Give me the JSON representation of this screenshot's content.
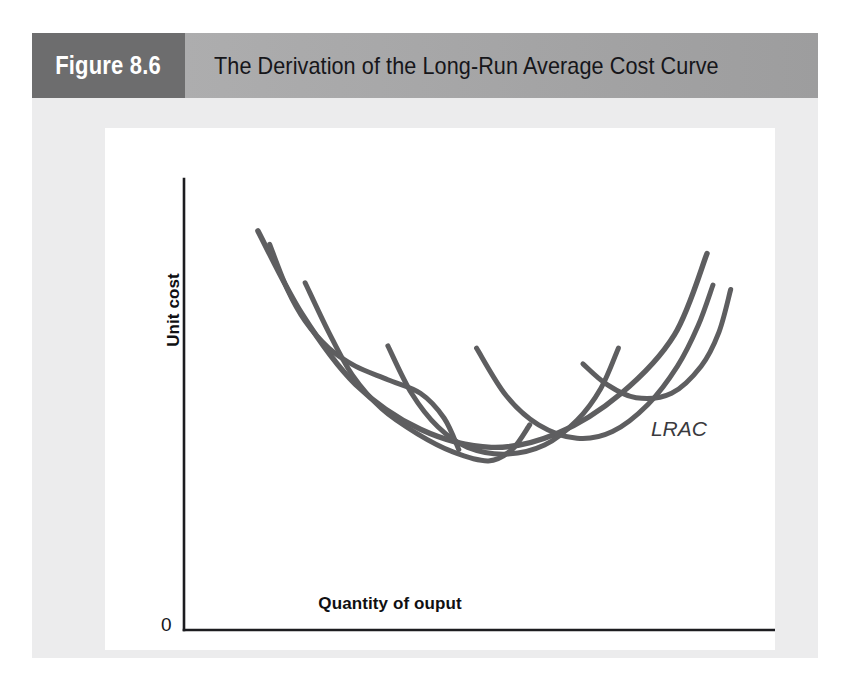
{
  "figure": {
    "number_label": "Figure 8.6",
    "title": "The Derivation of the Long-Run Average Cost Curve",
    "header_dark_color": "#6d6d6e",
    "header_light_color": "#a9a9aa",
    "card_background_color": "#ececed",
    "panel_background_color": "#ffffff"
  },
  "axes": {
    "y_title": "Unit cost",
    "x_title": "Quantity of ouput",
    "origin_label": "0",
    "axis_color": "#1c1c20"
  },
  "annotations": {
    "lrac_label": "LRAC"
  },
  "chart_data": {
    "type": "line",
    "title": "The Derivation of the Long-Run Average Cost Curve",
    "xlabel": "Quantity of ouput",
    "ylabel": "Unit cost",
    "grid": false,
    "legend": "none",
    "axis_ticks": [],
    "curve_color": "#5e5e60",
    "curve_stroke_width": 5,
    "xlim": [
      0,
      1
    ],
    "ylim": [
      0,
      1
    ],
    "annotations": [
      {
        "text": "LRAC",
        "x": 0.79,
        "y": 0.43,
        "style": "italic",
        "note": "labels the long-run average cost envelope curve"
      }
    ],
    "series": [
      {
        "name": "LRAC",
        "role": "envelope",
        "description": "Long-run average cost curve; U-shaped lower envelope tangent to every short-run average cost curve",
        "points": [
          {
            "x": 0.125,
            "y": 0.885
          },
          {
            "x": 0.2,
            "y": 0.7
          },
          {
            "x": 0.29,
            "y": 0.545
          },
          {
            "x": 0.4,
            "y": 0.445
          },
          {
            "x": 0.52,
            "y": 0.405
          },
          {
            "x": 0.63,
            "y": 0.435
          },
          {
            "x": 0.74,
            "y": 0.525
          },
          {
            "x": 0.83,
            "y": 0.655
          },
          {
            "x": 0.885,
            "y": 0.835
          }
        ]
      },
      {
        "name": "SRAC1",
        "role": "short-run",
        "description": "Short-run average cost curve for the smallest plant size; tangent to LRAC on its downward-sloping portion",
        "tangency_x": 0.205,
        "points": [
          {
            "x": 0.145,
            "y": 0.855
          },
          {
            "x": 0.175,
            "y": 0.755
          },
          {
            "x": 0.205,
            "y": 0.685
          },
          {
            "x": 0.245,
            "y": 0.625
          },
          {
            "x": 0.29,
            "y": 0.585
          },
          {
            "x": 0.345,
            "y": 0.555
          },
          {
            "x": 0.4,
            "y": 0.525
          },
          {
            "x": 0.44,
            "y": 0.47
          },
          {
            "x": 0.465,
            "y": 0.4
          }
        ]
      },
      {
        "name": "SRAC2",
        "role": "short-run",
        "description": "Short-run average cost curve for a small plant size; tangent to LRAC on its downward-sloping portion",
        "tangency_x": 0.315,
        "points": [
          {
            "x": 0.205,
            "y": 0.77
          },
          {
            "x": 0.245,
            "y": 0.66
          },
          {
            "x": 0.285,
            "y": 0.565
          },
          {
            "x": 0.335,
            "y": 0.49
          },
          {
            "x": 0.395,
            "y": 0.435
          },
          {
            "x": 0.455,
            "y": 0.395
          },
          {
            "x": 0.515,
            "y": 0.375
          },
          {
            "x": 0.555,
            "y": 0.4
          },
          {
            "x": 0.585,
            "y": 0.455
          }
        ]
      },
      {
        "name": "SRAC3",
        "role": "short-run",
        "description": "Short-run average cost curve for the optimal plant size; tangent to LRAC at the minimum of the long-run curve",
        "tangency_x": 0.5,
        "points": [
          {
            "x": 0.345,
            "y": 0.63
          },
          {
            "x": 0.385,
            "y": 0.525
          },
          {
            "x": 0.43,
            "y": 0.45
          },
          {
            "x": 0.48,
            "y": 0.405
          },
          {
            "x": 0.545,
            "y": 0.39
          },
          {
            "x": 0.61,
            "y": 0.41
          },
          {
            "x": 0.665,
            "y": 0.465
          },
          {
            "x": 0.705,
            "y": 0.535
          },
          {
            "x": 0.735,
            "y": 0.625
          }
        ]
      },
      {
        "name": "SRAC4",
        "role": "short-run",
        "description": "Short-run average cost curve for a large plant size; tangent to LRAC on its upward-sloping portion",
        "tangency_x": 0.675,
        "points": [
          {
            "x": 0.495,
            "y": 0.625
          },
          {
            "x": 0.545,
            "y": 0.52
          },
          {
            "x": 0.6,
            "y": 0.455
          },
          {
            "x": 0.665,
            "y": 0.425
          },
          {
            "x": 0.725,
            "y": 0.44
          },
          {
            "x": 0.785,
            "y": 0.5
          },
          {
            "x": 0.835,
            "y": 0.585
          },
          {
            "x": 0.87,
            "y": 0.675
          },
          {
            "x": 0.895,
            "y": 0.765
          }
        ]
      },
      {
        "name": "SRAC5",
        "role": "short-run",
        "description": "Short-run average cost curve for the largest plant size; tangent to LRAC on its upward-sloping portion",
        "tangency_x": 0.8,
        "points": [
          {
            "x": 0.675,
            "y": 0.59
          },
          {
            "x": 0.715,
            "y": 0.545
          },
          {
            "x": 0.765,
            "y": 0.515
          },
          {
            "x": 0.825,
            "y": 0.525
          },
          {
            "x": 0.875,
            "y": 0.585
          },
          {
            "x": 0.905,
            "y": 0.66
          },
          {
            "x": 0.925,
            "y": 0.755
          }
        ]
      }
    ]
  }
}
